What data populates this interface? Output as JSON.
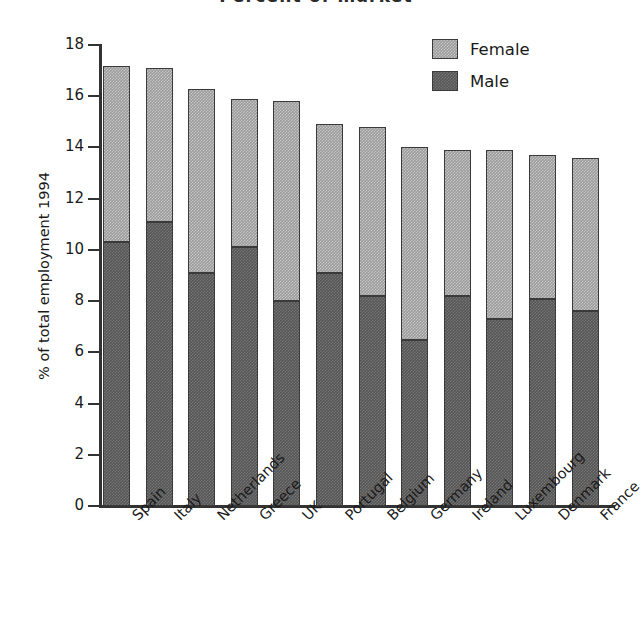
{
  "chart_data": {
    "type": "bar",
    "subtype": "stacked-vertical",
    "title": "Percent of market",
    "xlabel": "",
    "ylabel": "% of total employment 1994",
    "ylim": [
      0,
      18
    ],
    "ytick_step": 2,
    "ytick_labels": [
      "18",
      "16",
      "14",
      "12",
      "10",
      "8",
      "6",
      "4",
      "2",
      "0"
    ],
    "ytick_values": [
      18,
      16,
      14,
      12,
      10,
      8,
      6,
      4,
      2,
      0
    ],
    "grid": false,
    "legend_position": "top-right",
    "categories": [
      "Spain",
      "Italy",
      "Netherlands",
      "Greece",
      "UK",
      "Portugal",
      "Belgium",
      "Germany",
      "Ireland",
      "Luxembourg",
      "Denmark",
      "France"
    ],
    "series": [
      {
        "name": "Male",
        "color": "#565656",
        "values": [
          10.3,
          11.1,
          9.1,
          10.1,
          8.0,
          9.1,
          8.2,
          6.5,
          8.2,
          7.3,
          8.1,
          7.6
        ]
      },
      {
        "name": "Female",
        "color": "#9b9b9b",
        "values": [
          6.9,
          6.0,
          7.2,
          5.8,
          7.8,
          5.8,
          6.6,
          7.5,
          5.7,
          6.6,
          5.6,
          6.0
        ]
      }
    ],
    "totals": [
      17.2,
      17.1,
      16.3,
      15.9,
      15.8,
      14.9,
      14.8,
      14.0,
      13.9,
      13.9,
      13.7,
      13.6
    ],
    "bar_edge_color": "#3a3a3a"
  },
  "legend": {
    "entries": [
      {
        "label": "Female",
        "color": "#9b9b9b",
        "swatch": "female-swatch"
      },
      {
        "label": "Male",
        "color": "#565656",
        "swatch": "male-swatch"
      }
    ]
  }
}
